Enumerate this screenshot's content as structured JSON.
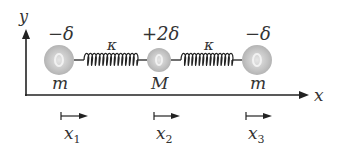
{
  "diagram": {
    "axes": {
      "y_label": "y",
      "x_label": "x"
    },
    "masses": [
      {
        "charge": "−δ",
        "mass_label": "m",
        "displacement_label": "x",
        "displacement_subscript": "1"
      },
      {
        "charge": "+2δ",
        "mass_label": "M",
        "displacement_label": "x",
        "displacement_subscript": "2"
      },
      {
        "charge": "−δ",
        "mass_label": "m",
        "displacement_label": "x",
        "displacement_subscript": "3"
      }
    ],
    "springs": [
      {
        "label": "κ"
      },
      {
        "label": "κ"
      }
    ],
    "colors": {
      "mass_fill": "#c8c8c8",
      "line": "#222222"
    }
  }
}
